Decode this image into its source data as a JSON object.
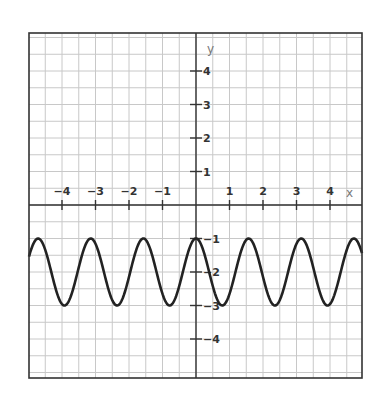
{
  "chart_data": {
    "type": "line",
    "title": "",
    "xlabel": "x",
    "ylabel": "y",
    "xlim": [
      -5,
      5
    ],
    "ylim": [
      -5.2,
      5.2
    ],
    "grid": true,
    "grid_step": 0.5,
    "x_ticks": [
      -4,
      -3,
      -2,
      -1,
      1,
      2,
      3,
      4
    ],
    "x_tick_labels": [
      "−4",
      "−3",
      "−2",
      "−1",
      "1",
      "2",
      "3",
      "4"
    ],
    "y_ticks": [
      4,
      3,
      2,
      1,
      -1,
      -2,
      -3,
      -4
    ],
    "y_tick_labels": [
      "4",
      "3",
      "2",
      "1",
      "−1",
      "−2",
      "−3",
      "−4"
    ],
    "series": [
      {
        "name": "y = cos(4x) − 2",
        "function": "cos(4x) - 2",
        "max": -1,
        "min": -3,
        "period": 1.5708,
        "color": "#222222",
        "x": [
          -5,
          -4.5,
          -4,
          -3.5,
          -3,
          -2.5,
          -2,
          -1.5,
          -1,
          -0.5,
          0,
          0.5,
          1,
          1.5,
          2,
          2.5,
          3,
          3.5,
          4,
          4.5,
          5
        ],
        "values": [
          -1.59,
          -1.59,
          -2.96,
          -1.86,
          -1.16,
          -2.84,
          -2.15,
          -1.04,
          -2.65,
          -2.42,
          -1,
          -2.42,
          -2.65,
          -1.04,
          -2.15,
          -2.84,
          -1.16,
          -1.86,
          -2.96,
          -1.59,
          -1.59
        ]
      }
    ],
    "legend": null
  },
  "colors": {
    "grid": "#c8c8c8",
    "axis": "#333333",
    "border": "#333333",
    "curve": "#222222"
  }
}
